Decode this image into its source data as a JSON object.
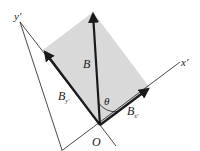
{
  "diagram": {
    "type": "vector-decomposition",
    "colors": {
      "background": "#ffffff",
      "shading": "#d9d9d9",
      "ink": "#1a1a1a"
    },
    "labels": {
      "y_axis": "y′",
      "x_axis": "x′",
      "vector": "B",
      "component_y": "B",
      "component_y_sub": "y′",
      "component_x": "B",
      "component_x_sub": "x′",
      "angle": "θ",
      "origin": "O"
    }
  }
}
